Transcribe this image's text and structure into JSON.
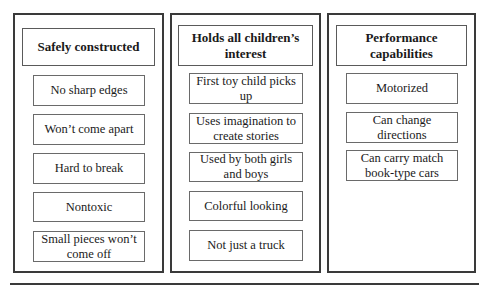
{
  "diagram": {
    "type": "attribute-tree-columns",
    "columns": [
      {
        "header": "Safely constructed",
        "items": [
          "No sharp edges",
          "Won’t come apart",
          "Hard to break",
          "Nontoxic",
          "Small pieces won’t come off"
        ]
      },
      {
        "header": "Holds all children’s interest",
        "items": [
          "First toy child picks up",
          "Uses imagination to create stories",
          "Used by both girls and boys",
          "Colorful looking",
          "Not just a truck"
        ]
      },
      {
        "header": "Performance capabilities",
        "items": [
          "Motorized",
          "Can change directions",
          "Can carry match book-type cars"
        ]
      }
    ],
    "colors": {
      "border_outer": "#3a3a3a",
      "border_inner": "#6a6a6a",
      "text": "#1a1a1a",
      "background": "#ffffff"
    }
  }
}
